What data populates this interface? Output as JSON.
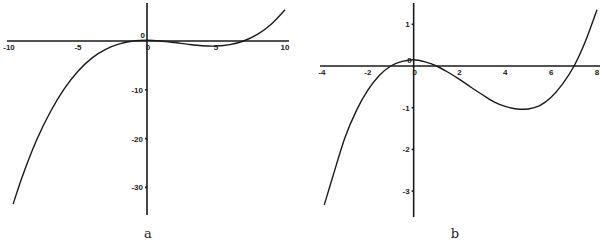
{
  "chart_data": [
    {
      "type": "line",
      "panel_label": "a",
      "title": "",
      "xlabel": "",
      "ylabel": "",
      "xlim": [
        -10,
        10
      ],
      "ylim": [
        -36,
        7
      ],
      "grid": false,
      "x_ticks": [
        {
          "value": -10,
          "label": "-10"
        },
        {
          "value": -5,
          "label": "-5"
        },
        {
          "value": 0,
          "label": "0"
        },
        {
          "value": 5,
          "label": "5"
        },
        {
          "value": 10,
          "label": "10"
        }
      ],
      "y_ticks": [
        {
          "value": 0,
          "label": "0"
        },
        {
          "value": -10,
          "label": "-10"
        },
        {
          "value": -20,
          "label": "-20"
        },
        {
          "value": -30,
          "label": "-30"
        }
      ],
      "series": [
        {
          "name": "f(x)",
          "x": [
            -9.7,
            -9,
            -8,
            -7,
            -6,
            -5,
            -4,
            -3,
            -2,
            -1,
            0,
            1,
            2,
            3,
            4,
            5,
            6,
            7,
            8,
            9,
            10
          ],
          "y": [
            -33.4,
            -27.5,
            -20.3,
            -14.5,
            -9.8,
            -6.2,
            -3.5,
            -1.7,
            -0.6,
            0,
            0.15,
            0,
            -0.32,
            -0.69,
            -0.97,
            -1.03,
            -0.75,
            0,
            1.35,
            3.44,
            6.39
          ]
        }
      ]
    },
    {
      "type": "line",
      "panel_label": "b",
      "title": "",
      "xlabel": "",
      "ylabel": "",
      "xlim": [
        -4,
        8
      ],
      "ylim": [
        -3.6,
        1.5
      ],
      "grid": false,
      "x_ticks": [
        {
          "value": -4,
          "label": "-4"
        },
        {
          "value": -2,
          "label": "-2"
        },
        {
          "value": 0,
          "label": "0"
        },
        {
          "value": 2,
          "label": "2"
        },
        {
          "value": 4,
          "label": "4"
        },
        {
          "value": 6,
          "label": "6"
        },
        {
          "value": 8,
          "label": "8"
        }
      ],
      "y_ticks": [
        {
          "value": 1,
          "label": "1"
        },
        {
          "value": 0,
          "label": "0"
        },
        {
          "value": -1,
          "label": "-1"
        },
        {
          "value": -2,
          "label": "-2"
        },
        {
          "value": -3,
          "label": "-3"
        }
      ],
      "series": [
        {
          "name": "f(x)",
          "x": [
            -3.9,
            -3.5,
            -3,
            -2.5,
            -2,
            -1.5,
            -1,
            -0.5,
            0,
            0.5,
            1,
            1.5,
            2,
            2.5,
            3,
            3.5,
            4,
            4.5,
            5,
            5.5,
            6,
            6.5,
            7,
            7.5,
            8
          ],
          "y": [
            -3.33,
            -2.6,
            -1.72,
            -1.07,
            -0.58,
            -0.23,
            0,
            0.11,
            0.15,
            0.1,
            0,
            -0.15,
            -0.32,
            -0.51,
            -0.69,
            -0.86,
            -0.97,
            -1.03,
            -1.03,
            -0.95,
            -0.75,
            -0.43,
            0,
            0.6,
            1.35
          ]
        }
      ]
    }
  ]
}
